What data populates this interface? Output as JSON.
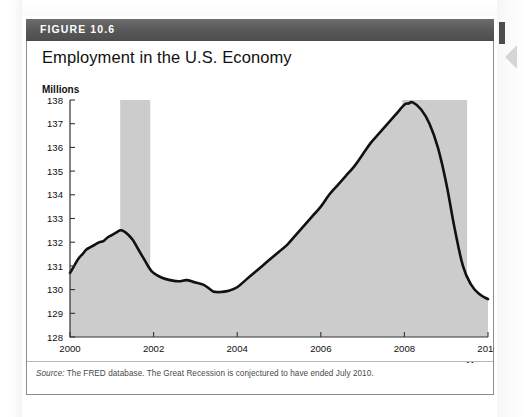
{
  "figure": {
    "badge": "FIGURE 10.6",
    "title": "Employment in the U.S. Economy",
    "source_prefix": "Source:",
    "source_text": " The FRED database. The Great Recession is conjectured to have ended July 2010."
  },
  "icons": {
    "nav_chevron": "chevron-left-icon"
  },
  "colors": {
    "header_bar": "#4d4d4d",
    "line": "#111111",
    "fill": "#cccccc",
    "recession_band": "#cccccc",
    "axis": "#333333",
    "box_border": "#8c8c8c"
  },
  "chart_data": {
    "type": "line",
    "title": "Employment in the U.S. Economy",
    "xlabel": "Year",
    "ylabel": "Millions",
    "xlim": [
      2000,
      2010
    ],
    "ylim": [
      128,
      138
    ],
    "grid": false,
    "legend": "none",
    "xticks": [
      2000,
      2002,
      2004,
      2006,
      2008,
      2010
    ],
    "xtick_labels": [
      "2000",
      "2002",
      "2004",
      "2006",
      "2008",
      "2010"
    ],
    "yticks": [
      128,
      129,
      130,
      131,
      132,
      133,
      134,
      135,
      136,
      137,
      138
    ],
    "ytick_labels": [
      "128",
      "129",
      "130",
      "131",
      "132",
      "133",
      "134",
      "135",
      "136",
      "137",
      "138"
    ],
    "annotations": [
      {
        "type": "shaded-band",
        "name": "recession-2001",
        "x_start": 2001.2,
        "x_end": 2001.92
      },
      {
        "type": "shaded-band",
        "name": "great-recession",
        "x_start": 2007.95,
        "x_end": 2009.5
      }
    ],
    "series": [
      {
        "name": "Total nonfarm employment",
        "unit": "millions of persons",
        "x": [
          2000.0,
          2000.1,
          2000.2,
          2000.3,
          2000.4,
          2000.5,
          2000.6,
          2000.7,
          2000.8,
          2000.9,
          2001.0,
          2001.1,
          2001.2,
          2001.3,
          2001.4,
          2001.5,
          2001.6,
          2001.7,
          2001.8,
          2001.9,
          2002.0,
          2002.2,
          2002.4,
          2002.6,
          2002.8,
          2003.0,
          2003.2,
          2003.4,
          2003.5,
          2003.6,
          2003.8,
          2004.0,
          2004.2,
          2004.4,
          2004.6,
          2004.8,
          2005.0,
          2005.2,
          2005.4,
          2005.6,
          2005.8,
          2006.0,
          2006.2,
          2006.4,
          2006.6,
          2006.8,
          2007.0,
          2007.2,
          2007.4,
          2007.6,
          2007.8,
          2008.0,
          2008.1,
          2008.2,
          2008.4,
          2008.6,
          2008.8,
          2009.0,
          2009.2,
          2009.4,
          2009.6,
          2009.8,
          2010.0
        ],
        "y": [
          130.7,
          131.0,
          131.3,
          131.5,
          131.7,
          131.8,
          131.9,
          132.0,
          132.05,
          132.2,
          132.3,
          132.4,
          132.5,
          132.45,
          132.3,
          132.1,
          131.8,
          131.5,
          131.2,
          130.9,
          130.7,
          130.5,
          130.4,
          130.35,
          130.4,
          130.3,
          130.2,
          129.95,
          129.9,
          129.9,
          129.95,
          130.1,
          130.4,
          130.7,
          131.0,
          131.3,
          131.6,
          131.9,
          132.3,
          132.7,
          133.1,
          133.5,
          134.0,
          134.4,
          134.8,
          135.2,
          135.7,
          136.2,
          136.6,
          137.0,
          137.4,
          137.8,
          137.85,
          137.9,
          137.6,
          137.0,
          136.0,
          134.5,
          132.6,
          131.0,
          130.2,
          129.8,
          129.6
        ]
      }
    ]
  }
}
